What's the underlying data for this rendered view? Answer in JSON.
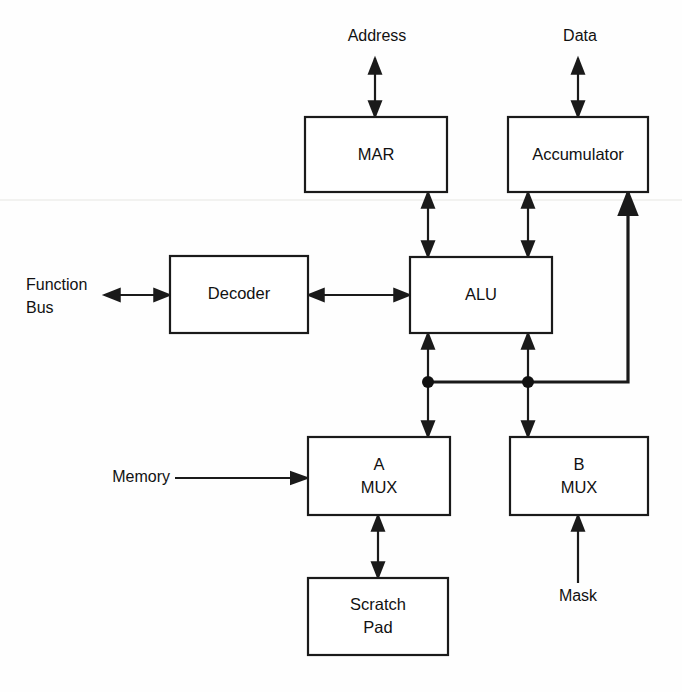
{
  "diagram": {
    "type": "block-diagram",
    "blocks": [
      {
        "id": "mar",
        "label": "MAR",
        "x": 305,
        "y": 117,
        "w": 142,
        "h": 75
      },
      {
        "id": "accumulator",
        "label": "Accumulator",
        "x": 508,
        "y": 117,
        "w": 140,
        "h": 75
      },
      {
        "id": "decoder",
        "label": "Decoder",
        "x": 170,
        "y": 256,
        "w": 138,
        "h": 77
      },
      {
        "id": "alu",
        "label": "ALU",
        "x": 410,
        "y": 257,
        "w": 142,
        "h": 76
      },
      {
        "id": "amux",
        "label_line1": "A",
        "label_line2": "MUX",
        "x": 308,
        "y": 437,
        "w": 142,
        "h": 78
      },
      {
        "id": "bmux",
        "label_line1": "B",
        "label_line2": "MUX",
        "x": 510,
        "y": 437,
        "w": 138,
        "h": 78
      },
      {
        "id": "scratchpad",
        "label_line1": "Scratch",
        "label_line2": "Pad",
        "x": 308,
        "y": 578,
        "w": 140,
        "h": 77
      }
    ],
    "io_labels": [
      {
        "id": "address",
        "text": "Address"
      },
      {
        "id": "data",
        "text": "Data"
      },
      {
        "id": "function_bus_line1",
        "text": "Function"
      },
      {
        "id": "function_bus_line2",
        "text": "Bus"
      },
      {
        "id": "memory",
        "text": "Memory"
      },
      {
        "id": "mask",
        "text": "Mask"
      }
    ],
    "connections": [
      {
        "from": "address-port",
        "to": "mar",
        "arrow": "double",
        "orientation": "vertical"
      },
      {
        "from": "data-port",
        "to": "accumulator",
        "arrow": "double",
        "orientation": "vertical"
      },
      {
        "from": "alu",
        "to": "mar",
        "arrow": "double",
        "orientation": "vertical"
      },
      {
        "from": "alu",
        "to": "accumulator",
        "arrow": "double",
        "orientation": "vertical"
      },
      {
        "from": "function-bus",
        "to": "decoder",
        "arrow": "double",
        "orientation": "horizontal"
      },
      {
        "from": "decoder",
        "to": "alu",
        "arrow": "double",
        "orientation": "horizontal"
      },
      {
        "from": "amux",
        "to": "alu",
        "arrow": "double",
        "orientation": "vertical"
      },
      {
        "from": "bmux",
        "to": "alu",
        "arrow": "double",
        "orientation": "vertical"
      },
      {
        "from": "accumulator",
        "to": "bus",
        "arrow": "single",
        "orientation": "feedback"
      },
      {
        "from": "memory-port",
        "to": "amux",
        "arrow": "single",
        "orientation": "horizontal"
      },
      {
        "from": "mask-port",
        "to": "bmux",
        "arrow": "single",
        "orientation": "vertical"
      },
      {
        "from": "amux",
        "to": "scratchpad",
        "arrow": "double",
        "orientation": "vertical"
      }
    ],
    "junctions": [
      {
        "id": "bus-junction-a",
        "x": 428,
        "y": 382
      },
      {
        "id": "bus-junction-b",
        "x": 528,
        "y": 382
      }
    ],
    "colors": {
      "line": "#1a1a1a",
      "background": "#fefefe",
      "text": "#111111"
    }
  }
}
